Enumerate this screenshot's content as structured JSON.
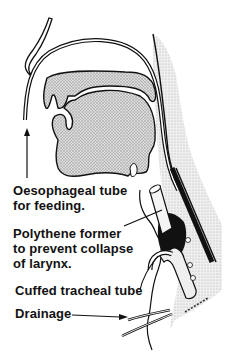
{
  "figure": {
    "labels": {
      "oesophageal_tube": [
        "Oesophageal tube",
        "for feeding."
      ],
      "polythene_former": [
        "Polythene former",
        "to prevent collapse",
        "of larynx."
      ],
      "cuffed_tracheal_tube": [
        "Cuffed tracheal tube"
      ],
      "drainage": [
        "Drainage"
      ]
    },
    "colors": {
      "ink": "#111111",
      "tissue_fill": "#c8c8c8",
      "skin_shade": "#d6d6d6",
      "background": "#ffffff"
    }
  }
}
